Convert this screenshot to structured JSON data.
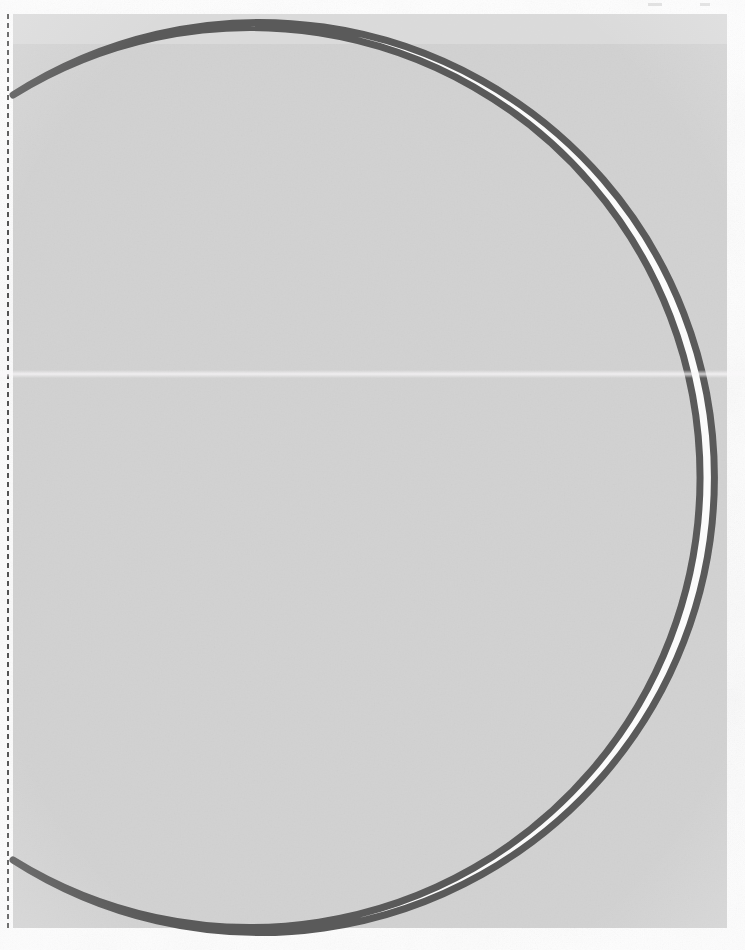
{
  "document": {
    "kind": "scanned-geometry-worksheet",
    "title": "Crescent (lune) figure",
    "page_width": 745,
    "page_height": 950,
    "background_color": "#fdfdfd",
    "paper_tint": "#fbfbfc"
  },
  "shaded_region": {
    "name": "shaded-rectangle",
    "description": "Light gray rectangular region behind the crescent",
    "fill_color": "#d5d5d5",
    "x": 13,
    "y": 14,
    "width": 714,
    "height": 914
  },
  "guide_line": {
    "name": "dashed-vertical-guide",
    "orientation": "vertical",
    "color": "#3c3c3c",
    "style": "dashed",
    "x": 8,
    "y_start": 14,
    "y_end": 930,
    "dash_length": 5,
    "gap_length": 4,
    "stroke_width": 2
  },
  "crescent": {
    "name": "crescent-lune",
    "fill_color": "#fbfbfb",
    "stroke_color": "#5a5a5a",
    "stroke_width": 7,
    "outer_arc": {
      "name": "outer-arc",
      "description": "Large convex arc bulging right",
      "center_x": 274,
      "center_y": 476,
      "radius": 455,
      "start_point": [
        13,
        95
      ],
      "end_point": [
        13,
        860
      ],
      "sweep": "clockwise-right"
    },
    "inner_arc": {
      "name": "inner-arc",
      "description": "Smaller concave arc bulging right, forming the bite",
      "center_x": -240,
      "center_y": 476,
      "radius": 450,
      "start_point": [
        13,
        95
      ],
      "end_point": [
        13,
        860
      ],
      "apex_x": 209,
      "sweep": "counter-clockwise-right"
    },
    "cusps": [
      {
        "name": "upper-cusp",
        "x": 13,
        "y": 95
      },
      {
        "name": "lower-cusp",
        "x": 13,
        "y": 860
      }
    ]
  },
  "margin_marks": {
    "name": "top-edge-scan-marks",
    "description": "Faint printer registration ticks along the very top edge",
    "color": "#c9c9c9",
    "marks": [
      {
        "x": 648,
        "y": 3,
        "width": 14,
        "height": 3
      },
      {
        "x": 700,
        "y": 3,
        "width": 10,
        "height": 3
      }
    ]
  }
}
